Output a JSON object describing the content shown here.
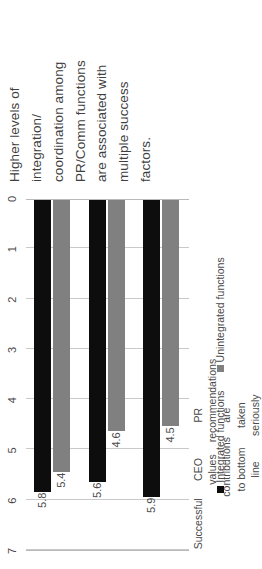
{
  "title": {
    "lines": [
      "Higher levels of",
      "integration/",
      "coordination among",
      "PR/Comm functions",
      "are associated with",
      "multiple success",
      "factors."
    ]
  },
  "chart_data": {
    "type": "bar",
    "orientation": "horizontal",
    "categories": [
      "Successful",
      "CEO values contributions to bottom line",
      "PR recommendations are taken seriously"
    ],
    "category_lines": [
      [
        "Successful"
      ],
      [
        "CEO values contributions",
        "to bottom line"
      ],
      [
        "PR recommendations are",
        "taken seriously"
      ]
    ],
    "series": [
      {
        "name": "Integrated functions",
        "color": "#0d0d0d",
        "values": [
          5.8,
          5.6,
          5.9
        ],
        "labels": [
          "5.8",
          "5.6",
          "5.9"
        ]
      },
      {
        "name": "Unintegrated functions",
        "color": "#808080",
        "values": [
          5.4,
          4.6,
          4.5
        ],
        "labels": [
          "5.4",
          "4.6",
          "4.5"
        ]
      }
    ],
    "xlabel": "",
    "ylabel": "",
    "ylim": [
      0,
      7
    ],
    "ticks": [
      "0",
      "1",
      "2",
      "3",
      "4",
      "5",
      "6",
      "7"
    ],
    "grid": true,
    "legend_position": "bottom"
  },
  "colors": {
    "series_integrated": "#0d0d0d",
    "series_unintegrated": "#808080",
    "text": "#3f3f3f",
    "axis": "#b9b9b9",
    "grid": "#c9c9c9",
    "background": "#ffffff"
  }
}
